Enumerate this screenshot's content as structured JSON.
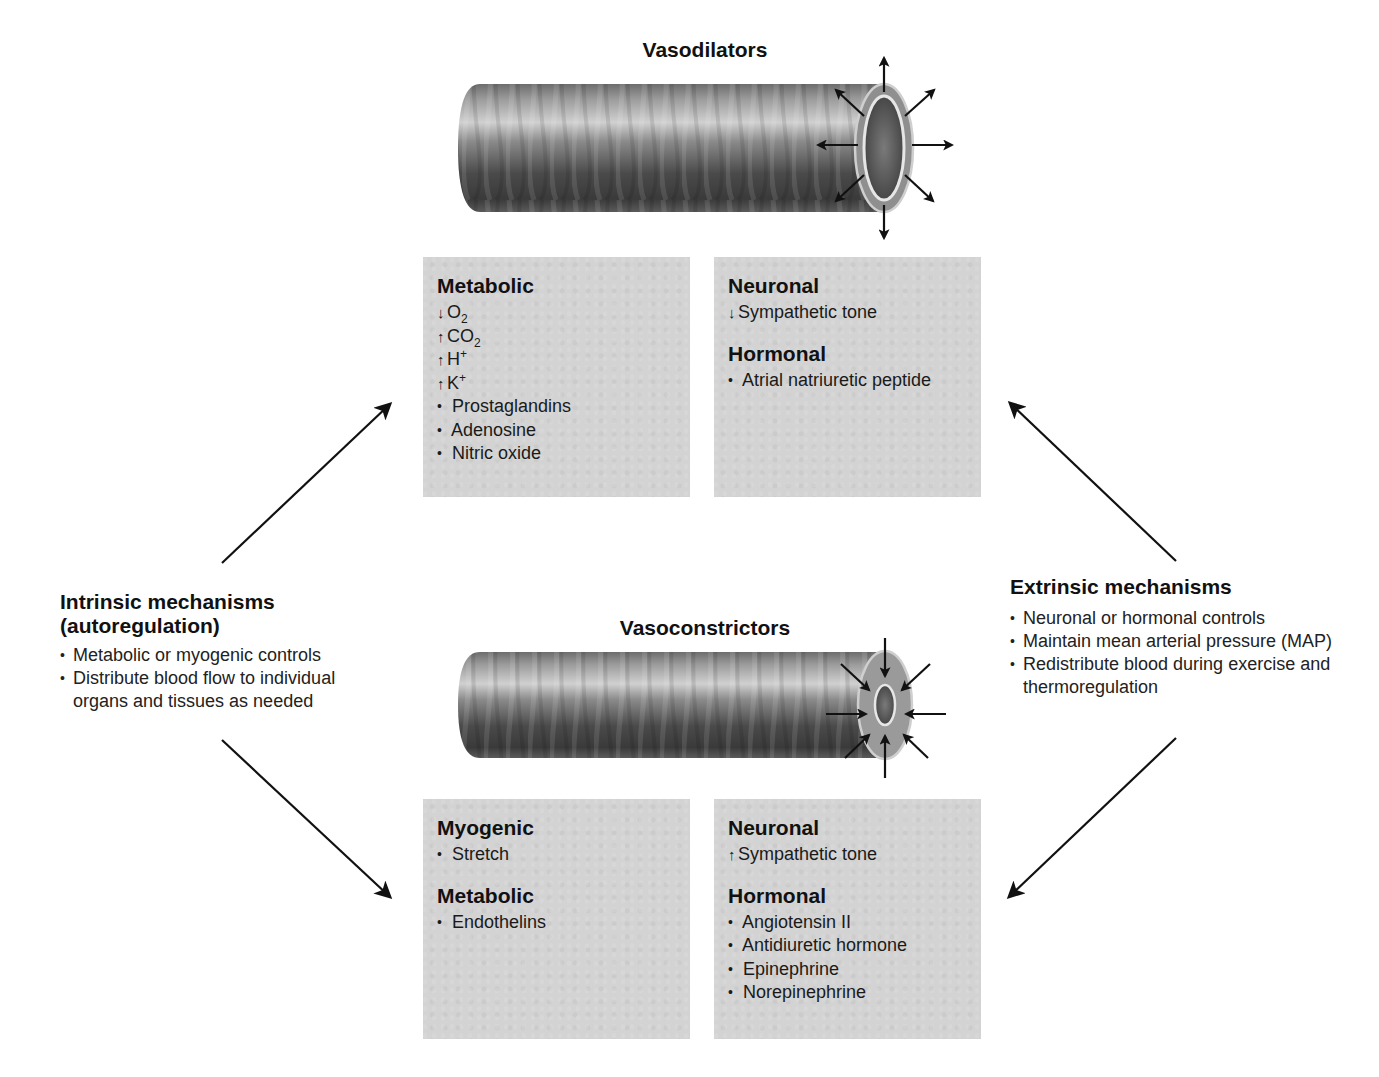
{
  "diagram": {
    "vasodilators": {
      "title": "Vasodilators",
      "vessel_icon": "dilated-vessel-icon",
      "arrow_direction": "outward",
      "intrinsic_box": {
        "sections": [
          {
            "heading": "Metabolic",
            "items": [
              {
                "marker": "down-arrow",
                "glyph": "↓",
                "text": "O",
                "sub": "2",
                "sup": ""
              },
              {
                "marker": "up-arrow",
                "glyph": "↑",
                "text": "CO",
                "sub": "2",
                "sup": ""
              },
              {
                "marker": "up-arrow",
                "glyph": "↑",
                "text": "H",
                "sub": "",
                "sup": "+"
              },
              {
                "marker": "up-arrow",
                "glyph": "↑",
                "text": "K",
                "sub": "",
                "sup": "+"
              },
              {
                "marker": "bullet",
                "glyph": "•",
                "text": "Prostaglandins",
                "sub": "",
                "sup": ""
              },
              {
                "marker": "bullet",
                "glyph": "•",
                "text": "Adenosine",
                "sub": "",
                "sup": ""
              },
              {
                "marker": "bullet",
                "glyph": "•",
                "text": "Nitric oxide",
                "sub": "",
                "sup": ""
              }
            ]
          }
        ]
      },
      "extrinsic_box": {
        "sections": [
          {
            "heading": "Neuronal",
            "items": [
              {
                "marker": "down-arrow",
                "glyph": "↓",
                "text": "Sympathetic tone"
              }
            ]
          },
          {
            "heading": "Hormonal",
            "items": [
              {
                "marker": "bullet",
                "glyph": "•",
                "text": "Atrial natriuretic peptide"
              }
            ]
          }
        ]
      }
    },
    "vasoconstrictors": {
      "title": "Vasoconstrictors",
      "vessel_icon": "constricted-vessel-icon",
      "arrow_direction": "inward",
      "intrinsic_box": {
        "sections": [
          {
            "heading": "Myogenic",
            "items": [
              {
                "marker": "bullet",
                "glyph": "•",
                "text": "Stretch"
              }
            ]
          },
          {
            "heading": "Metabolic",
            "items": [
              {
                "marker": "bullet",
                "glyph": "•",
                "text": "Endothelins"
              }
            ]
          }
        ]
      },
      "extrinsic_box": {
        "sections": [
          {
            "heading": "Neuronal",
            "items": [
              {
                "marker": "up-arrow",
                "glyph": "↑",
                "text": "Sympathetic tone"
              }
            ]
          },
          {
            "heading": "Hormonal",
            "items": [
              {
                "marker": "bullet",
                "glyph": "•",
                "text": "Angiotensin II"
              },
              {
                "marker": "bullet",
                "glyph": "•",
                "text": "Antidiuretic hormone"
              },
              {
                "marker": "bullet",
                "glyph": "•",
                "text": "Epinephrine"
              },
              {
                "marker": "bullet",
                "glyph": "•",
                "text": "Norepinephrine"
              }
            ]
          }
        ]
      }
    },
    "intrinsic_mechanisms": {
      "title_line1": "Intrinsic mechanisms",
      "title_line2": "(autoregulation)",
      "bullets": [
        "Metabolic or myogenic controls",
        "Distribute blood flow to individual organs and tissues as needed"
      ]
    },
    "extrinsic_mechanisms": {
      "title": "Extrinsic mechanisms",
      "bullets": [
        "Neuronal or hormonal controls",
        "Maintain mean arterial pressure (MAP)",
        "Redistribute blood during exercise and thermoregulation"
      ]
    },
    "bullet_glyph": "•",
    "colors": {
      "box_fill": "#d3d3d3",
      "text": "#1a1a1a",
      "arrow": "#111111",
      "vessel_dark": "#3a3a3a",
      "vessel_light": "#bdbdbd",
      "vessel_wall": "#8f8f8f"
    }
  }
}
